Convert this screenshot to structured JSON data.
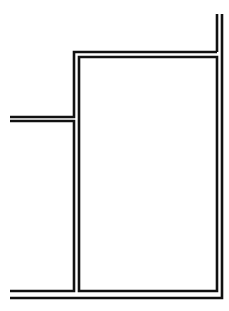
{
  "diagram": {
    "type": "double-line floor plan fragment",
    "stroke_color": "#111111",
    "background_color": "#ffffff",
    "walls": [
      {
        "name": "outer-right-wall",
        "points": [
          [
            222,
            14
          ],
          [
            222,
            298
          ],
          [
            10,
            298
          ]
        ]
      },
      {
        "name": "inner-room-top-outer",
        "points": [
          [
            217,
            52
          ],
          [
            74,
            52
          ],
          [
            74,
            117
          ],
          [
            10,
            117
          ]
        ]
      },
      {
        "name": "corridor-left-lower",
        "points": [
          [
            10,
            121
          ],
          [
            74,
            121
          ],
          [
            74,
            291
          ],
          [
            10,
            291
          ]
        ]
      },
      {
        "name": "inner-right-wall",
        "points": [
          [
            217,
            14
          ],
          [
            217,
            52
          ]
        ]
      },
      {
        "name": "room-inner-outline",
        "points": [
          [
            79,
            57
          ],
          [
            217,
            57
          ],
          [
            217,
            291
          ],
          [
            79,
            291
          ],
          [
            79,
            57
          ]
        ]
      }
    ]
  }
}
